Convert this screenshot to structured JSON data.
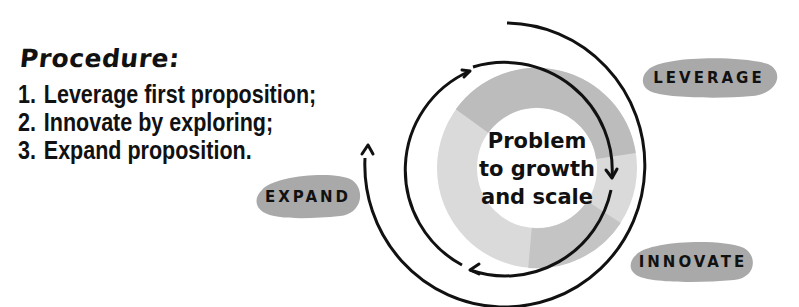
{
  "procedure": {
    "heading": "Procedure:",
    "steps": [
      {
        "num": "1.",
        "text": "Leverage first proposition;"
      },
      {
        "num": "2.",
        "text": "Innovate by exploring;"
      },
      {
        "num": "3.",
        "text": "Expand proposition."
      }
    ]
  },
  "diagram": {
    "center": {
      "line1": "Problem",
      "line2": "to growth",
      "line3": "and scale"
    },
    "labels": {
      "leverage": "LEVERAGE",
      "innovate": "INNOVATE",
      "expand": "EXPAND"
    },
    "colors": {
      "ring_dark": "#b9b9b9",
      "ring_light": "#d9d9d9",
      "pill": "#a9a9a9",
      "stroke": "#111111"
    }
  }
}
